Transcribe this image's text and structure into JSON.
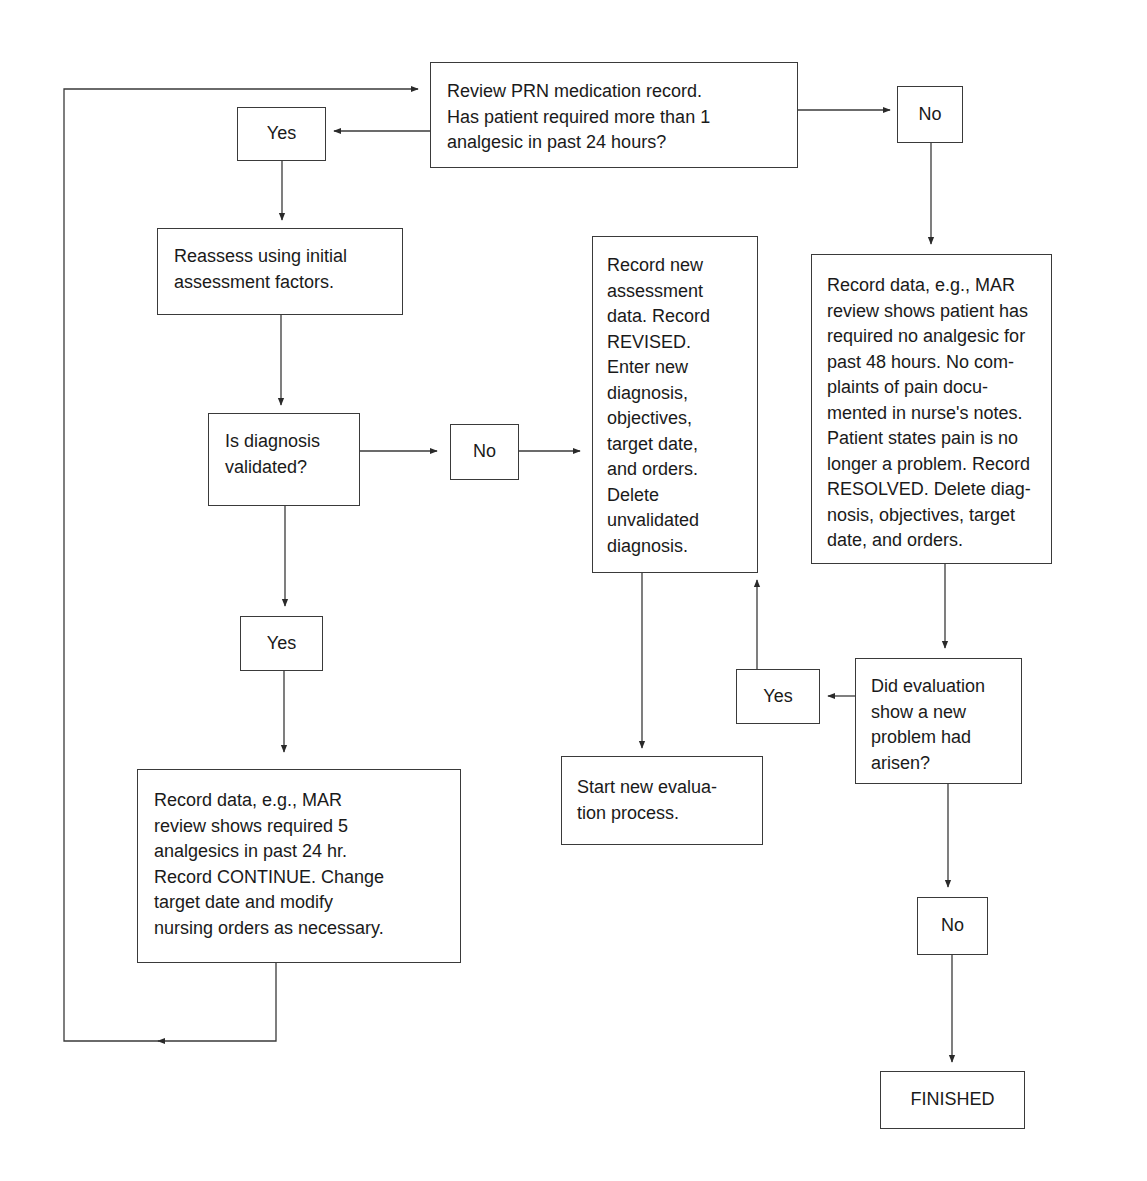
{
  "diagram": {
    "type": "flowchart",
    "colors": {
      "stroke": "#3a3a3a",
      "text": "#1a1a1a",
      "background": "#ffffff"
    },
    "nodes": {
      "review_prn": {
        "label": "Review PRN medication record.\nHas patient required more than 1\nanalgesic in past 24 hours?"
      },
      "yes_top": {
        "label": "Yes"
      },
      "no_top": {
        "label": "No"
      },
      "reassess": {
        "label": "Reassess using initial\nassessment factors."
      },
      "diagnosis_validated": {
        "label": "Is diagnosis\nvalidated?"
      },
      "no_diagnosis": {
        "label": "No"
      },
      "record_revised": {
        "label": "Record new\nassessment\ndata. Record\nREVISED.\nEnter new\ndiagnosis,\nobjectives,\ntarget date,\nand orders.\nDelete\nunvalidated\ndiagnosis."
      },
      "record_resolved": {
        "label": "Record data, e.g., MAR\nreview shows patient has\nrequired no analgesic for\npast 48 hours. No com-\nplaints of pain docu-\nmented in nurse's notes.\nPatient states pain is no\nlonger a problem. Record\nRESOLVED. Delete diag-\nnosis, objectives, target\ndate, and orders."
      },
      "yes_validated": {
        "label": "Yes"
      },
      "yes_new_problem": {
        "label": "Yes"
      },
      "new_problem_question": {
        "label": "Did evaluation\nshow a new\nproblem had\narisen?"
      },
      "start_new_evaluation": {
        "label": "Start new evalua-\ntion process."
      },
      "record_continue": {
        "label": "Record data, e.g., MAR\nreview shows required 5\nanalgesics in past 24 hr.\nRecord CONTINUE. Change\ntarget date and modify\nnursing orders as necessary."
      },
      "no_new_problem": {
        "label": "No"
      },
      "finished": {
        "label": "FINISHED"
      }
    },
    "edges": [
      {
        "from": "review_prn",
        "to": "yes_top"
      },
      {
        "from": "review_prn",
        "to": "no_top"
      },
      {
        "from": "yes_top",
        "to": "reassess"
      },
      {
        "from": "reassess",
        "to": "diagnosis_validated"
      },
      {
        "from": "diagnosis_validated",
        "to": "no_diagnosis"
      },
      {
        "from": "no_diagnosis",
        "to": "record_revised"
      },
      {
        "from": "diagnosis_validated",
        "to": "yes_validated"
      },
      {
        "from": "yes_validated",
        "to": "record_continue"
      },
      {
        "from": "record_continue",
        "to": "review_prn",
        "note": "loop back"
      },
      {
        "from": "no_top",
        "to": "record_resolved"
      },
      {
        "from": "record_resolved",
        "to": "new_problem_question"
      },
      {
        "from": "new_problem_question",
        "to": "yes_new_problem"
      },
      {
        "from": "yes_new_problem",
        "to": "record_revised"
      },
      {
        "from": "record_revised",
        "to": "start_new_evaluation"
      },
      {
        "from": "new_problem_question",
        "to": "no_new_problem"
      },
      {
        "from": "no_new_problem",
        "to": "finished"
      }
    ]
  }
}
